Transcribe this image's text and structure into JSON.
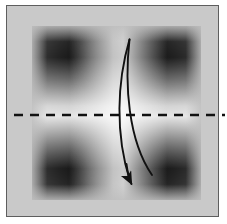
{
  "figure": {
    "caption": "",
    "background_color": "#ffffff",
    "matte_color": "#c9c9c9",
    "matte_border_color": "#5e5e5e"
  },
  "panel": {
    "name": "gradient-artwork",
    "description": "Grayscale blurred pattern with four dark lobes on the diagonals and a bright cross along the central axes",
    "base_color": "#b4b4b4",
    "dark_color": "#0c0c0c",
    "light_color": "#ffffff",
    "bounds": {
      "x": 32,
      "y": 26,
      "width": 169,
      "height": 174
    }
  },
  "annotations": {
    "fold_line": {
      "label": "valley fold line",
      "style": "dashed",
      "color": "#111111",
      "stroke_width": 2.4,
      "dash_pattern": "9 7",
      "y": 103,
      "x_start": 0,
      "x_end": 211
    },
    "fold_arrow": {
      "label": "fold arrow",
      "color": "#111111",
      "stroke_width": 1.9,
      "direction": "top-to-bottom",
      "start": {
        "x": 115,
        "y": 27
      },
      "end": {
        "x": 119,
        "y": 176
      },
      "arrowhead": "solid-filled"
    }
  }
}
